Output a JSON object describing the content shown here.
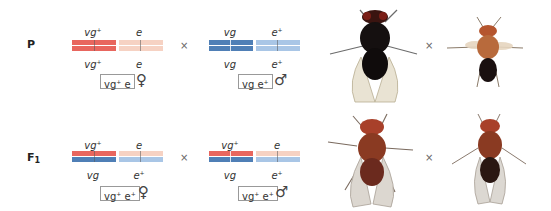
{
  "generations": [
    {
      "label": "P",
      "parents": [
        {
          "sex": "female",
          "sex_symbol": "♀",
          "chromosomes": [
            {
              "top_allele": "vg",
              "top_plus": "+",
              "bottom_allele": "vg",
              "bottom_plus": "+",
              "top_color": "#e8665e",
              "bottom_color": "#e8665e"
            },
            {
              "top_allele": "e",
              "top_plus": "",
              "bottom_allele": "e",
              "bottom_plus": "",
              "top_color": "#f6d2c3",
              "bottom_color": "#f6d2c3"
            }
          ],
          "genotype": {
            "a": "vg",
            "a_plus": "+",
            "b": "e",
            "b_plus": ""
          }
        },
        {
          "sex": "male",
          "sex_symbol": "♂",
          "chromosomes": [
            {
              "top_allele": "vg",
              "top_plus": "",
              "bottom_allele": "vg",
              "bottom_plus": "",
              "top_color": "#4f7fb6",
              "bottom_color": "#4f7fb6"
            },
            {
              "top_allele": "e",
              "top_plus": "+",
              "bottom_allele": "e",
              "bottom_plus": "+",
              "top_color": "#a9c6e6",
              "bottom_color": "#a9c6e6"
            }
          ],
          "genotype": {
            "a": "vg",
            "a_plus": "",
            "b": "e",
            "b_plus": "+"
          }
        }
      ],
      "cross_symbol": "×",
      "photo_cross_symbol": "×",
      "flies": [
        {
          "description": "wild-type wings, ebony body (female)"
        },
        {
          "description": "vestigial wings, tan body (male)"
        }
      ]
    },
    {
      "label": "F",
      "label_sub": "1",
      "parents": [
        {
          "sex": "female",
          "sex_symbol": "♀",
          "chromosomes": [
            {
              "top_allele": "vg",
              "top_plus": "+",
              "bottom_allele": "vg",
              "bottom_plus": "",
              "top_color": "#e8665e",
              "bottom_color": "#4f7fb6"
            },
            {
              "top_allele": "e",
              "top_plus": "",
              "bottom_allele": "e",
              "bottom_plus": "+",
              "top_color": "#f6d2c3",
              "bottom_color": "#a9c6e6"
            }
          ],
          "genotype": {
            "a": "vg",
            "a_plus": "+",
            "b": "e",
            "b_plus": "+"
          }
        },
        {
          "sex": "male",
          "sex_symbol": "♂",
          "chromosomes": [
            {
              "top_allele": "vg",
              "top_plus": "+",
              "bottom_allele": "vg",
              "bottom_plus": "",
              "top_color": "#e8665e",
              "bottom_color": "#4f7fb6"
            },
            {
              "top_allele": "e",
              "top_plus": "",
              "bottom_allele": "e",
              "bottom_plus": "+",
              "top_color": "#f6d2c3",
              "bottom_color": "#a9c6e6"
            }
          ],
          "genotype": {
            "a": "vg",
            "a_plus": "+",
            "b": "e",
            "b_plus": "+"
          }
        }
      ],
      "cross_symbol": "×",
      "photo_cross_symbol": "×",
      "flies": [
        {
          "description": "wild-type F1 female"
        },
        {
          "description": "wild-type F1 male"
        }
      ]
    }
  ]
}
